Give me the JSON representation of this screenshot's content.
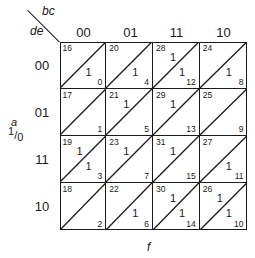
{
  "axes": {
    "corner_top_var": "bc",
    "corner_left_var": "de",
    "column_labels": [
      "00",
      "01",
      "11",
      "10"
    ],
    "row_labels": [
      "00",
      "01",
      "11",
      "10"
    ],
    "split_var": "a",
    "split_values": {
      "top": "1",
      "sep": "/",
      "bottom": "0"
    },
    "output_var": "f"
  },
  "grid": {
    "rows": [
      {
        "de": "00",
        "cells": [
          {
            "top_num": "16",
            "top_val": "",
            "bot_val": "1",
            "bot_num": "0"
          },
          {
            "top_num": "20",
            "top_val": "",
            "bot_val": "1",
            "bot_num": "4"
          },
          {
            "top_num": "28",
            "top_val": "1",
            "bot_val": "1",
            "bot_num": "12"
          },
          {
            "top_num": "24",
            "top_val": "",
            "bot_val": "1",
            "bot_num": "8"
          }
        ]
      },
      {
        "de": "01",
        "cells": [
          {
            "top_num": "17",
            "top_val": "",
            "bot_val": "",
            "bot_num": "1"
          },
          {
            "top_num": "21",
            "top_val": "1",
            "bot_val": "",
            "bot_num": "5"
          },
          {
            "top_num": "29",
            "top_val": "1",
            "bot_val": "",
            "bot_num": "13"
          },
          {
            "top_num": "25",
            "top_val": "",
            "bot_val": "",
            "bot_num": "9"
          }
        ]
      },
      {
        "de": "11",
        "cells": [
          {
            "top_num": "19",
            "top_val": "1",
            "bot_val": "1",
            "bot_num": "3"
          },
          {
            "top_num": "23",
            "top_val": "1",
            "bot_val": "",
            "bot_num": "7"
          },
          {
            "top_num": "31",
            "top_val": "1",
            "bot_val": "",
            "bot_num": "15"
          },
          {
            "top_num": "27",
            "top_val": "",
            "bot_val": "1",
            "bot_num": "11"
          }
        ]
      },
      {
        "de": "10",
        "cells": [
          {
            "top_num": "18",
            "top_val": "",
            "bot_val": "",
            "bot_num": "2"
          },
          {
            "top_num": "22",
            "top_val": "",
            "bot_val": "1",
            "bot_num": "6"
          },
          {
            "top_num": "30",
            "top_val": "1",
            "bot_val": "1",
            "bot_num": "14"
          },
          {
            "top_num": "26",
            "top_val": "1",
            "bot_val": "1",
            "bot_num": "10"
          }
        ]
      }
    ]
  },
  "colors": {
    "ink": "#1a1a1a",
    "background": "#ffffff"
  }
}
